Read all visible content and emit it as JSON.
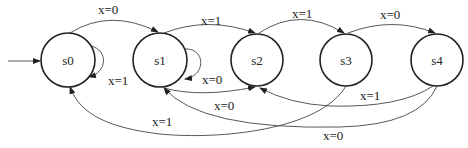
{
  "states": [
    {
      "id": "s0",
      "label": "s0",
      "cx": 68,
      "cy": 60,
      "r": 27,
      "initial": true
    },
    {
      "id": "s1",
      "label": "s1",
      "cx": 160,
      "cy": 60,
      "r": 27
    },
    {
      "id": "s2",
      "label": "s2",
      "cx": 257,
      "cy": 60,
      "r": 26
    },
    {
      "id": "s3",
      "label": "s3",
      "cx": 346,
      "cy": 60,
      "r": 26
    },
    {
      "id": "s4",
      "label": "s4",
      "cx": 437,
      "cy": 60,
      "r": 26
    }
  ],
  "transitions": [
    {
      "from": "s0",
      "to": "s1",
      "label": "x=0"
    },
    {
      "from": "s0",
      "to": "s0",
      "label": "x=1"
    },
    {
      "from": "s1",
      "to": "s2",
      "label": "x=1"
    },
    {
      "from": "s1",
      "to": "s1",
      "label": "x=0"
    },
    {
      "from": "s1",
      "to": "s2",
      "label": "x=0"
    },
    {
      "from": "s2",
      "to": "s3",
      "label": "x=1"
    },
    {
      "from": "s3",
      "to": "s4",
      "label": "x=0"
    },
    {
      "from": "s3",
      "to": "s0",
      "label": "x=1"
    },
    {
      "from": "s4",
      "to": "s2",
      "label": "x=1"
    },
    {
      "from": "s4",
      "to": "s1",
      "label": "x=0"
    }
  ],
  "labels": {
    "s0": "s0",
    "s1": "s1",
    "s2": "s2",
    "s3": "s3",
    "s4": "s4",
    "e_s0_s1": "x=0",
    "e_s0_s0": "x=1",
    "e_s1_s2_top": "x=1",
    "e_s1_s1": "x=0",
    "e_s1_s2_bot": "x=0",
    "e_s2_s3": "x=1",
    "e_s3_s4": "x=0",
    "e_s3_s0": "x=1",
    "e_s4_s2": "x=1",
    "e_s4_s1": "x=0"
  }
}
